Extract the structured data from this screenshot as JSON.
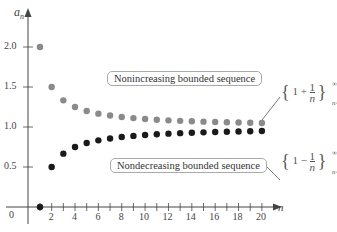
{
  "chart_data": {
    "type": "scatter",
    "title": "",
    "xlabel": "n",
    "ylabel": "a_n",
    "xlim": [
      0,
      21
    ],
    "ylim": [
      0,
      2.2
    ],
    "x_ticks": [
      2,
      4,
      6,
      8,
      10,
      12,
      14,
      16,
      18,
      20
    ],
    "y_ticks": [
      0.5,
      1.0,
      1.5,
      2.0
    ],
    "y_tick_labels": [
      "0.5",
      "1.0",
      "1.5",
      "2.0"
    ],
    "origin_label": "0",
    "grid": false,
    "series": [
      {
        "name": "{1 + 1/n} n=1..∞",
        "label": "Nonincreasing bounded sequence",
        "color": "#8a8a8a",
        "x": [
          1,
          2,
          3,
          4,
          5,
          6,
          7,
          8,
          9,
          10,
          11,
          12,
          13,
          14,
          15,
          16,
          17,
          18,
          19,
          20
        ],
        "values": [
          2.0,
          1.5,
          1.333,
          1.25,
          1.2,
          1.167,
          1.143,
          1.125,
          1.111,
          1.1,
          1.091,
          1.083,
          1.077,
          1.071,
          1.067,
          1.0625,
          1.059,
          1.056,
          1.053,
          1.05
        ]
      },
      {
        "name": "{1 - 1/n} n=1..∞",
        "label": "Nondecreasing bounded sequence",
        "color": "#1a1a1a",
        "x": [
          1,
          2,
          3,
          4,
          5,
          6,
          7,
          8,
          9,
          10,
          11,
          12,
          13,
          14,
          15,
          16,
          17,
          18,
          19,
          20
        ],
        "values": [
          0,
          0.5,
          0.667,
          0.75,
          0.8,
          0.833,
          0.857,
          0.875,
          0.889,
          0.9,
          0.909,
          0.917,
          0.923,
          0.929,
          0.933,
          0.9375,
          0.941,
          0.944,
          0.947,
          0.95
        ]
      }
    ],
    "annotations": [
      {
        "text": "Nonincreasing bounded sequence",
        "series": 0
      },
      {
        "text": "Nondecreasing bounded sequence",
        "series": 1
      }
    ]
  },
  "labels": {
    "y_axis": "a",
    "y_axis_sub": "n",
    "x_axis": "n",
    "origin": "0",
    "box_upper": "Nonincreasing bounded sequence",
    "box_lower": "Nondecreasing bounded sequence",
    "formula_upper": {
      "open": "{",
      "one": "1",
      "op": "+",
      "num": "1",
      "den": "n",
      "close": "}",
      "sup": "∞",
      "sub": "n=1"
    },
    "formula_lower": {
      "open": "{",
      "one": "1",
      "op": "−",
      "num": "1",
      "den": "n",
      "close": "}",
      "sup": "∞",
      "sub": "n=1"
    }
  }
}
